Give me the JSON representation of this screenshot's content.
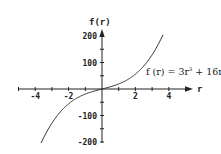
{
  "chart_data": {
    "type": "line",
    "title": "",
    "xlabel": "r",
    "ylabel": "f(r)",
    "xlim": [
      -5,
      5.3
    ],
    "ylim": [
      -200,
      220
    ],
    "grid": false,
    "x_ticks": [
      -4,
      -2,
      2,
      4
    ],
    "x_tick_labels": [
      "-4",
      "-2",
      "2",
      "4"
    ],
    "x_minor_ticks": [
      -5,
      -4,
      -3,
      -2,
      -1,
      1,
      2,
      3,
      4,
      5
    ],
    "y_ticks": [
      -200,
      -100,
      100,
      200
    ],
    "y_tick_labels": [
      "-200",
      "-100",
      "100",
      "200"
    ],
    "y_minor_ticks": [
      -200,
      -150,
      -100,
      -50,
      50,
      100,
      150,
      200
    ],
    "annotation": {
      "text_prefix": "f (r) = 3r",
      "superscript": "3",
      "text_suffix": " + 16r"
    },
    "series": [
      {
        "name": "f(r) = 3r^3 + 16r",
        "function": "3r^3 + 16r",
        "x": [
          -3.65,
          -3,
          -2.5,
          -2,
          -1.5,
          -1,
          -0.5,
          0,
          0.5,
          1,
          1.5,
          2,
          2.5,
          3,
          3.65
        ],
        "values": [
          -204.3,
          -129,
          -86.9,
          -56,
          -34.1,
          -19,
          -8.4,
          0,
          8.4,
          19,
          34.1,
          56,
          86.9,
          129,
          204.3
        ]
      }
    ]
  }
}
